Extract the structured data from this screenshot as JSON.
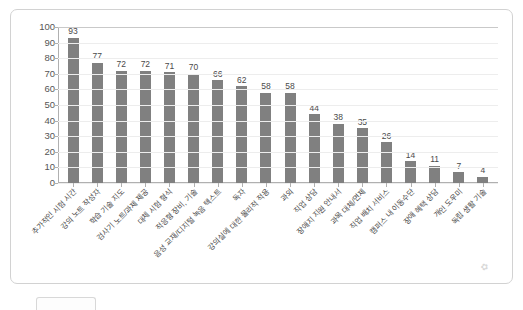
{
  "chart_data": {
    "type": "bar",
    "title": "",
    "xlabel": "",
    "ylabel": "",
    "ylim": [
      0,
      100
    ],
    "ytick_step": 10,
    "yticks": [
      100,
      90,
      80,
      70,
      60,
      50,
      40,
      30,
      20,
      10,
      0
    ],
    "grid": true,
    "legend": "none",
    "orientation": "vertical",
    "bar_color": "#808080",
    "categories": [
      "추가적인 시험 시간",
      "강의 노트 작성자",
      "학습 기술 지도",
      "검사기 노트/과제 제공",
      "대체 시험 형식",
      "적응형 장비, 기술",
      "음성 교재/디지털 녹음 텍스트",
      "독자",
      "강의실에 대한 물리적 적용",
      "과외",
      "직업 상담",
      "장애지 지원 안내서",
      "과목 대체/면제",
      "직업 배치 서비스",
      "캠퍼스 내 이동수단",
      "장애 혜택 상담",
      "개인 도우미",
      "독립 생활 기술"
    ],
    "values": [
      93,
      77,
      72,
      72,
      71,
      70,
      66,
      62,
      58,
      58,
      44,
      38,
      35,
      26,
      14,
      11,
      7,
      4
    ]
  }
}
